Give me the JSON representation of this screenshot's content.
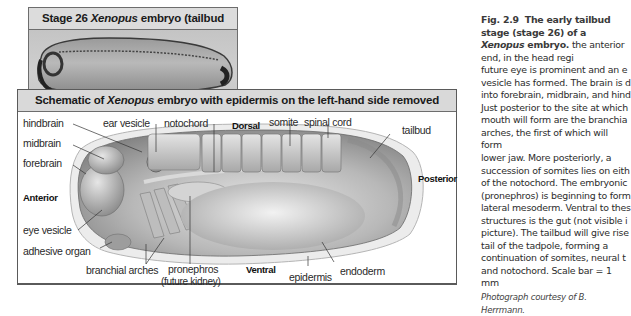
{
  "photo_panel": {
    "title_prefix": "Stage 26 ",
    "title_italic": "Xenopus",
    "title_suffix": " embryo (tailbud stage)",
    "scale_bar_label": "Scale bar = 1 mm"
  },
  "schematic_panel": {
    "title_prefix": "Schematic of ",
    "title_italic": "Xenopus",
    "title_suffix": " embryo with epidermis on the left-hand side removed",
    "labels": {
      "hindbrain": "hindbrain",
      "midbrain": "midbrain",
      "forebrain": "forebrain",
      "anterior": "Anterior",
      "eye_vesicle": "eye vesicle",
      "adhesive_organ": "adhesive organ",
      "branchial_arches": "branchial arches",
      "ear_vesicle": "ear vesicle",
      "notochord": "notochord",
      "dorsal": "Dorsal",
      "somite": "somite",
      "spinal_cord": "spinal cord",
      "tailbud": "tailbud",
      "posterior": "Posterior",
      "pronephros": "pronephros",
      "pronephros_note": "(future kidney)",
      "ventral": "Ventral",
      "epidermis": "epidermis",
      "endoderm": "endoderm"
    }
  },
  "caption": {
    "fig_number": "Fig. 2.9",
    "heading_prefix": "The early tailbud stage (stage 26) of a ",
    "heading_italic": "Xenopus",
    "heading_suffix": " embryo.",
    "lines": [
      "the anterior end, in the head regi",
      "future eye is prominent and an e",
      "vesicle has formed. The brain is d",
      "into forebrain, midbrain, and hind",
      "Just posterior to the site at which",
      "mouth will form are the branchia",
      "arches, the first of which will form",
      "lower jaw. More posteriorly, a",
      "succession of somites lies on eith",
      "of the notochord. The embryonic",
      "(pronephros) is beginning to form",
      "lateral mesoderm. Ventral to thes",
      "structures is the gut (not visible i",
      "picture). The tailbud will give rise",
      "tail of the tadpole, forming a",
      "continuation of somites, neural t",
      "and notochord. Scale bar = 1 mm"
    ],
    "credit": "Photograph courtesy of B. Herrmann."
  }
}
